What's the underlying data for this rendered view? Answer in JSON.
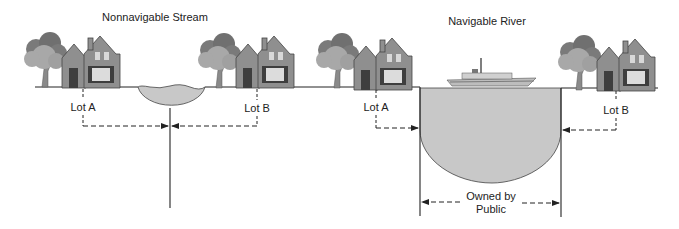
{
  "left_panel": {
    "title": "Nonnavigable Stream",
    "lot_a": "Lot A",
    "lot_b": "Lot B"
  },
  "right_panel": {
    "title": "Navigable River",
    "lot_a": "Lot A",
    "lot_b": "Lot B",
    "public_line1": "Owned by",
    "public_line2": "Public"
  },
  "colors": {
    "house": "#8f8f8f",
    "house_dark": "#4a4a4a",
    "tree_light": "#a8a8a8",
    "tree_dark": "#707070",
    "water": "#c8c8c8",
    "line": "#222222"
  }
}
